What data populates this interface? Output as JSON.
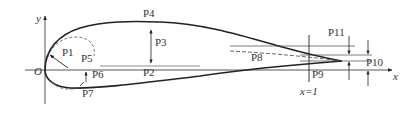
{
  "diagram": {
    "axes": {
      "x_label": "x",
      "y_label": "y",
      "origin_label": "O",
      "trailing_edge_marker": "x=1"
    },
    "parameters": [
      {
        "id": "P1",
        "label": "P1"
      },
      {
        "id": "P2",
        "label": "P2"
      },
      {
        "id": "P3",
        "label": "P3"
      },
      {
        "id": "P4",
        "label": "P4"
      },
      {
        "id": "P5",
        "label": "P5"
      },
      {
        "id": "P6",
        "label": "P6"
      },
      {
        "id": "P7",
        "label": "P7"
      },
      {
        "id": "P8",
        "label": "P8"
      },
      {
        "id": "P9",
        "label": "P9"
      },
      {
        "id": "P10",
        "label": "P10"
      },
      {
        "id": "P11",
        "label": "P11"
      }
    ],
    "colors": {
      "line": "#222222",
      "text": "#333333",
      "background": "#ffffff"
    }
  }
}
